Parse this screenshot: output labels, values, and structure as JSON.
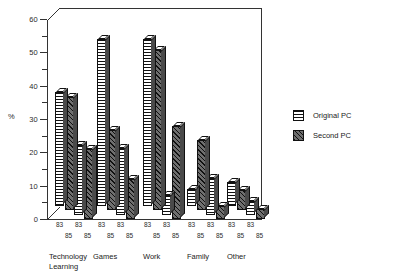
{
  "chart_data": {
    "type": "bar",
    "title": "",
    "xlabel": "",
    "ylabel": "%",
    "ylim": [
      0,
      60
    ],
    "yticks": [
      0,
      10,
      20,
      30,
      40,
      50,
      60
    ],
    "ytick_labels": [
      "0",
      "10",
      "20",
      "30",
      "40",
      "50",
      "60"
    ],
    "minor_tick_step": 5,
    "grid": false,
    "legend_position": "right",
    "categories": [
      "Technology Learning",
      "Games",
      "Work",
      "Family",
      "Other"
    ],
    "sub_categories": [
      "83",
      "85"
    ],
    "series": [
      {
        "name": "Original PC",
        "pattern": "horizontal-lines",
        "values_83": [
          34,
          50,
          50,
          5,
          7
        ],
        "values_85": [
          21,
          20,
          6,
          11,
          4
        ]
      },
      {
        "name": "Second PC",
        "pattern": "diagonal-hatch",
        "values_83": [
          34,
          24,
          48,
          21,
          6
        ],
        "values_85": [
          21,
          12,
          28,
          4,
          3
        ]
      }
    ],
    "bars": [
      {
        "group": "Technology Learning",
        "series": "Original PC",
        "year": "83",
        "value": 34
      },
      {
        "group": "Technology Learning",
        "series": "Second PC",
        "year": "83",
        "value": 34
      },
      {
        "group": "Technology Learning",
        "series": "Original PC",
        "year": "85",
        "value": 21
      },
      {
        "group": "Technology Learning",
        "series": "Second PC",
        "year": "85",
        "value": 21
      },
      {
        "group": "Games",
        "series": "Original PC",
        "year": "83",
        "value": 50
      },
      {
        "group": "Games",
        "series": "Second PC",
        "year": "83",
        "value": 24
      },
      {
        "group": "Games",
        "series": "Original PC",
        "year": "85",
        "value": 20
      },
      {
        "group": "Games",
        "series": "Second PC",
        "year": "85",
        "value": 12
      },
      {
        "group": "Work",
        "series": "Original PC",
        "year": "83",
        "value": 50
      },
      {
        "group": "Work",
        "series": "Second PC",
        "year": "83",
        "value": 48
      },
      {
        "group": "Work",
        "series": "Original PC",
        "year": "85",
        "value": 6
      },
      {
        "group": "Work",
        "series": "Second PC",
        "year": "85",
        "value": 28
      },
      {
        "group": "Family",
        "series": "Original PC",
        "year": "83",
        "value": 5
      },
      {
        "group": "Family",
        "series": "Second PC",
        "year": "83",
        "value": 21
      },
      {
        "group": "Family",
        "series": "Original PC",
        "year": "85",
        "value": 11
      },
      {
        "group": "Family",
        "series": "Second PC",
        "year": "85",
        "value": 4
      },
      {
        "group": "Other",
        "series": "Original PC",
        "year": "83",
        "value": 7
      },
      {
        "group": "Other",
        "series": "Second PC",
        "year": "83",
        "value": 6
      },
      {
        "group": "Other",
        "series": "Original PC",
        "year": "85",
        "value": 4
      },
      {
        "group": "Other",
        "series": "Second PC",
        "year": "85",
        "value": 3
      }
    ]
  },
  "axis": {
    "y_title": "%",
    "tick_labels": [
      "0",
      "10",
      "20",
      "30",
      "40",
      "50",
      "60"
    ]
  },
  "categories": [
    {
      "line1": "Technology",
      "line2": "Learning"
    },
    {
      "line1": "Games",
      "line2": ""
    },
    {
      "line1": "Work",
      "line2": ""
    },
    {
      "line1": "Family",
      "line2": ""
    },
    {
      "line1": "Other",
      "line2": ""
    }
  ],
  "year_labels": {
    "first": "83",
    "second": "85"
  },
  "legend": {
    "items": [
      {
        "label": "Original PC",
        "pattern": "horizontal-lines"
      },
      {
        "label": "Second PC",
        "pattern": "diagonal-hatch"
      }
    ]
  },
  "colors": {
    "ink": "#111111",
    "bar_side": "#4a4a4a",
    "bar_top": "#ffffff",
    "hatch_base": "#6f6f6f",
    "background": "#ffffff"
  }
}
